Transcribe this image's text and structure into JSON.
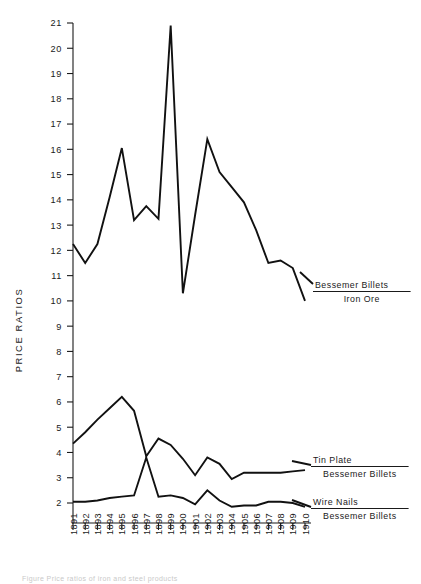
{
  "figure": {
    "axis_title_y": "PRICE RATIOS",
    "caption": "Figure   Price ratios of iron and steel products"
  },
  "chart_data": {
    "type": "line",
    "title": "",
    "xlabel": "",
    "ylabel": "PRICE RATIOS",
    "xlim": [
      1891,
      1910
    ],
    "ylim": [
      2,
      21
    ],
    "yticks": [
      2,
      3,
      4,
      5,
      6,
      7,
      8,
      9,
      10,
      11,
      12,
      13,
      14,
      15,
      16,
      17,
      18,
      19,
      20,
      21
    ],
    "grid": false,
    "legend_position": "right-inline",
    "categories": [
      1891,
      1892,
      1893,
      1894,
      1895,
      1896,
      1897,
      1898,
      1899,
      1900,
      1901,
      1902,
      1903,
      1904,
      1905,
      1906,
      1907,
      1908,
      1909,
      1910
    ],
    "xticklabels": [
      "1891",
      "1892",
      "1893",
      "1894",
      "1895",
      "1896",
      "1897",
      "1898",
      "1899",
      "1900",
      "1901",
      "1902",
      "1903",
      "1904",
      "1905",
      "1906",
      "1907",
      "1908",
      "1909",
      "1910"
    ],
    "series": [
      {
        "name": "Bessemer Billets / Iron Ore",
        "numerator": "Bessemer Billets",
        "denominator": "Iron Ore",
        "values": [
          12.25,
          11.5,
          12.25,
          14.1,
          16.05,
          13.2,
          13.75,
          13.25,
          20.9,
          10.3,
          13.4,
          16.4,
          15.1,
          14.5,
          13.9,
          12.8,
          11.5,
          11.6,
          11.3,
          10.0
        ]
      },
      {
        "name": "Tin Plate / Bessemer Billets",
        "numerator": "Tin Plate",
        "denominator": "Bessemer Billets",
        "values": [
          4.35,
          4.8,
          5.3,
          5.75,
          6.2,
          5.65,
          3.85,
          4.55,
          4.3,
          3.75,
          3.1,
          3.8,
          3.55,
          2.95,
          3.2,
          3.2,
          3.2,
          3.2,
          3.25,
          3.3
        ]
      },
      {
        "name": "Wire Nails / Bessemer Billets",
        "numerator": "Wire Nails",
        "denominator": "Bessemer Billets",
        "values": [
          2.05,
          2.05,
          2.1,
          2.2,
          2.25,
          2.3,
          3.8,
          2.25,
          2.3,
          2.2,
          1.95,
          2.5,
          2.1,
          1.85,
          1.9,
          1.9,
          2.05,
          2.05,
          2.0,
          1.85
        ]
      }
    ]
  },
  "legend": [
    {
      "numerator": "Bessemer Billets",
      "denominator": "Iron Ore"
    },
    {
      "numerator": "Tin Plate",
      "denominator": "Bessemer Billets"
    },
    {
      "numerator": "Wire Nails",
      "denominator": "Bessemer Billets"
    }
  ]
}
